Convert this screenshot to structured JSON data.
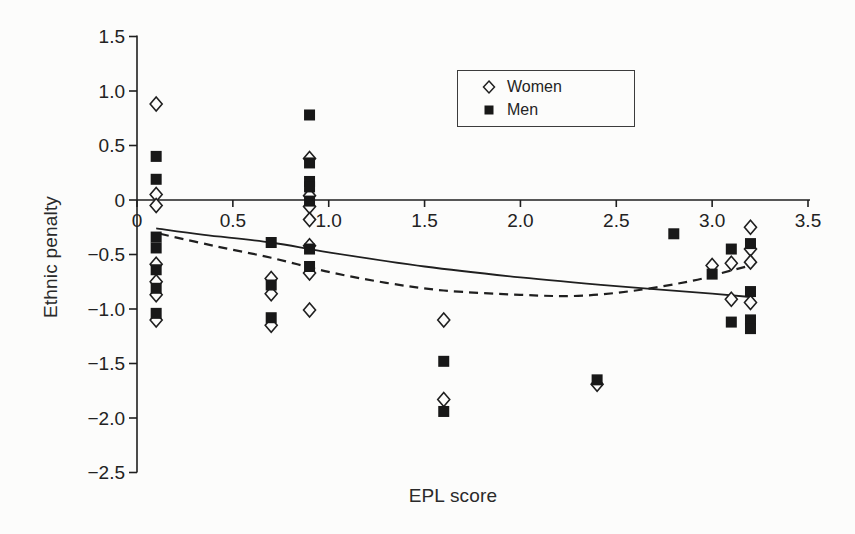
{
  "figure": {
    "background": "#fcfcfb",
    "ink": "#1f1f1f"
  },
  "chart_data": {
    "type": "scatter",
    "title": "",
    "xlabel": "EPL score",
    "ylabel": "Ethnic penalty",
    "xlim": [
      0,
      3.5
    ],
    "ylim": [
      -2.5,
      1.5
    ],
    "grid": false,
    "x_ticks": [
      0,
      0.5,
      1.0,
      1.5,
      2.0,
      2.5,
      3.0,
      3.5
    ],
    "x_tick_labels": [
      "0",
      "0.5",
      "1.0",
      "1.5",
      "2.0",
      "2.5",
      "3.0",
      "3.5"
    ],
    "y_ticks": [
      1.5,
      1.0,
      0.5,
      0,
      -0.5,
      -1.0,
      -1.5,
      -2.0,
      -2.5
    ],
    "y_tick_labels": [
      "1.5",
      "1.0",
      "0.5",
      "0",
      "−0.5",
      "−1.0",
      "−1.5",
      "−2.0",
      "−2.5"
    ],
    "legend": {
      "position": "top-center",
      "entries": [
        {
          "label": "Women",
          "marker": "open-diamond"
        },
        {
          "label": "Men",
          "marker": "filled-square"
        }
      ]
    },
    "series": [
      {
        "name": "Women",
        "marker": "open-diamond",
        "points": [
          [
            0.1,
            0.88
          ],
          [
            0.1,
            0.05
          ],
          [
            0.1,
            -0.05
          ],
          [
            0.1,
            -0.59
          ],
          [
            0.1,
            -0.75
          ],
          [
            0.1,
            -0.87
          ],
          [
            0.1,
            -1.1
          ],
          [
            0.7,
            -0.72
          ],
          [
            0.7,
            -0.86
          ],
          [
            0.7,
            -1.15
          ],
          [
            0.9,
            0.38
          ],
          [
            0.9,
            0.04
          ],
          [
            0.9,
            -0.06
          ],
          [
            0.9,
            -0.18
          ],
          [
            0.9,
            -0.42
          ],
          [
            0.9,
            -0.67
          ],
          [
            0.9,
            -1.01
          ],
          [
            1.6,
            -1.1
          ],
          [
            1.6,
            -1.83
          ],
          [
            2.4,
            -1.69
          ],
          [
            3.0,
            -0.6
          ],
          [
            3.1,
            -0.58
          ],
          [
            3.1,
            -0.91
          ],
          [
            3.2,
            -0.25
          ],
          [
            3.2,
            -0.45
          ],
          [
            3.2,
            -0.57
          ],
          [
            3.2,
            -0.94
          ]
        ]
      },
      {
        "name": "Men",
        "marker": "filled-square",
        "points": [
          [
            0.1,
            0.4
          ],
          [
            0.1,
            0.19
          ],
          [
            0.1,
            -0.34
          ],
          [
            0.1,
            -0.44
          ],
          [
            0.1,
            -0.64
          ],
          [
            0.1,
            -0.81
          ],
          [
            0.1,
            -1.04
          ],
          [
            0.7,
            -0.39
          ],
          [
            0.7,
            -0.78
          ],
          [
            0.7,
            -1.08
          ],
          [
            0.9,
            0.78
          ],
          [
            0.9,
            0.34
          ],
          [
            0.9,
            0.17
          ],
          [
            0.9,
            0.12
          ],
          [
            0.9,
            -0.01
          ],
          [
            0.9,
            -0.45
          ],
          [
            0.9,
            -0.61
          ],
          [
            1.6,
            -1.48
          ],
          [
            1.6,
            -1.94
          ],
          [
            2.4,
            -1.65
          ],
          [
            2.8,
            -0.31
          ],
          [
            3.0,
            -0.68
          ],
          [
            3.1,
            -0.45
          ],
          [
            3.1,
            -1.12
          ],
          [
            3.2,
            -0.4
          ],
          [
            3.2,
            -0.84
          ],
          [
            3.2,
            -1.1
          ],
          [
            3.2,
            -1.18
          ]
        ]
      }
    ],
    "trend_lines": [
      {
        "name": "trend-solid",
        "style": "solid",
        "points": [
          [
            0.1,
            -0.26
          ],
          [
            0.35,
            -0.32
          ],
          [
            0.7,
            -0.39
          ],
          [
            1.0,
            -0.48
          ],
          [
            1.5,
            -0.61
          ],
          [
            2.0,
            -0.71
          ],
          [
            2.5,
            -0.79
          ],
          [
            3.0,
            -0.86
          ],
          [
            3.2,
            -0.89
          ]
        ]
      },
      {
        "name": "trend-dashed",
        "style": "dashed",
        "points": [
          [
            0.12,
            -0.31
          ],
          [
            0.4,
            -0.42
          ],
          [
            0.7,
            -0.53
          ],
          [
            1.0,
            -0.66
          ],
          [
            1.3,
            -0.76
          ],
          [
            1.6,
            -0.83
          ],
          [
            2.0,
            -0.87
          ],
          [
            2.3,
            -0.88
          ],
          [
            2.6,
            -0.83
          ],
          [
            2.9,
            -0.74
          ],
          [
            3.05,
            -0.67
          ],
          [
            3.2,
            -0.6
          ]
        ]
      }
    ]
  }
}
